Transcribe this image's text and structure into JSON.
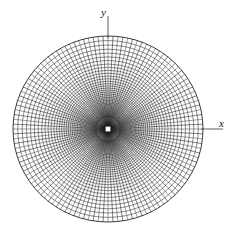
{
  "figure": {
    "name": "polar-conformal-grid",
    "title": "",
    "background_color": "#ffffff",
    "line_color": "#1a1a1a",
    "center_marker_color": "#ffffff"
  },
  "axes": {
    "x_label": "x",
    "y_label": "y",
    "x_tick_label": "",
    "y_tick_label": ""
  },
  "chart_data": {
    "type": "line",
    "title": "",
    "subtitle": "",
    "xlabel": "x",
    "ylabel": "y",
    "grid": true,
    "legend_position": "none",
    "coordinate_system": "polar",
    "center": {
      "x": 108,
      "y": 129
    },
    "outer_radius_x": 95,
    "outer_radius_y": 93,
    "radial_spokes": {
      "count": 120,
      "angle_step_deg": 3,
      "start_angle_deg": 0
    },
    "circles": {
      "count": 42,
      "radius_ratio": 0.9,
      "outer_radius": 95,
      "min_radius": 1.6,
      "radii": [
        95,
        90.3,
        85.8,
        81.5,
        77.5,
        73.6,
        69.9,
        66.4,
        63.1,
        60.0,
        57.0,
        54.1,
        51.4,
        48.8,
        46.4,
        44.1,
        41.9,
        39.8,
        37.8,
        35.9,
        34.1,
        32.4,
        30.8,
        29.2,
        27.8,
        26.4,
        25.1,
        23.8,
        22.6,
        21.5,
        20.4,
        19.4,
        18.4,
        17.5,
        16.6,
        15.8,
        15.0,
        14.2,
        13.5,
        12.9,
        12.2,
        11.6
      ]
    },
    "axis_ticks": {
      "x_axis_extension": 20,
      "y_axis_extension": 20
    },
    "xlim": [
      -1.08,
      1.15
    ],
    "ylim": [
      -1.1,
      1.12
    ]
  }
}
